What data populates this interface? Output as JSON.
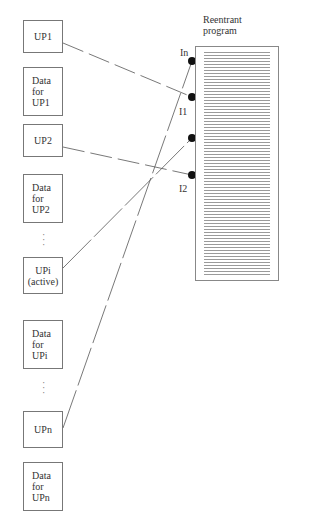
{
  "program": {
    "title_line1": "Reentrant",
    "title_line2": "program"
  },
  "entry_points": [
    {
      "label": "In"
    },
    {
      "label": "I1"
    },
    {
      "label": ""
    },
    {
      "label": "I2"
    }
  ],
  "left_column": [
    {
      "type": "process",
      "line1": "UP1",
      "line2": ""
    },
    {
      "type": "data",
      "line1": "Data",
      "line2": "for",
      "line3": "UP1"
    },
    {
      "type": "process",
      "line1": "UP2",
      "line2": ""
    },
    {
      "type": "data",
      "line1": "Data",
      "line2": "for",
      "line3": "UP2"
    },
    {
      "type": "process",
      "line1": "UPi",
      "line2": "(active)"
    },
    {
      "type": "data",
      "line1": "Data",
      "line2": "for",
      "line3": "UPi"
    },
    {
      "type": "process",
      "line1": "UPn",
      "line2": ""
    },
    {
      "type": "data",
      "line1": "Data",
      "line2": "for",
      "line3": "UPn"
    }
  ],
  "ellipsis": "·\n·\n·"
}
